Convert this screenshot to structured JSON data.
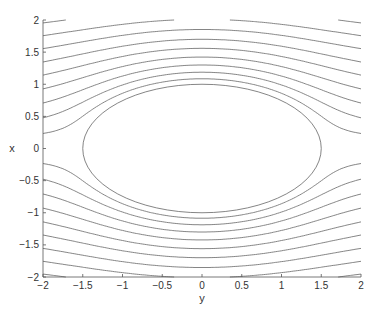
{
  "chart_data": {
    "type": "contour",
    "title": "",
    "xlabel": "y",
    "ylabel": "x",
    "xlim": [
      -2,
      2
    ],
    "ylim": [
      -2,
      2
    ],
    "xticks": [
      -2,
      -1.5,
      -1,
      -0.5,
      0,
      0.5,
      1,
      1.5,
      2
    ],
    "yticks": [
      -2,
      -1.5,
      -1,
      -0.5,
      0,
      0.5,
      1,
      1.5,
      2
    ],
    "xtick_labels": [
      "-2",
      "-1.5",
      "-1",
      "-0.5",
      "0",
      "0.5",
      "1",
      "1.5",
      "2"
    ],
    "ytick_labels": [
      "-2",
      "-1.5",
      "-1",
      "-0.5",
      "0",
      "0.5",
      "1",
      "1.5",
      "2"
    ],
    "grid": false,
    "legend": null,
    "body": {
      "shape": "ellipse",
      "center": [
        0,
        0
      ],
      "semi_axis_horizontal": 1.5,
      "semi_axis_vertical": 1.0
    },
    "stream_levels": [
      0.14,
      0.3,
      0.47,
      0.65,
      0.84,
      1.03,
      1.23,
      1.43,
      1.63,
      1.84,
      2.05,
      2.26,
      2.47,
      2.68,
      2.9,
      -0.14,
      -0.3,
      -0.47,
      -0.65,
      -0.84,
      -1.03,
      -1.23,
      -1.43,
      -1.63,
      -1.84,
      -2.05,
      -2.26,
      -2.47,
      -2.68,
      -2.9
    ],
    "line_color": "#666666",
    "axis_color": "#555555"
  },
  "axes": {
    "xlabel": "y",
    "ylabel": "x"
  }
}
